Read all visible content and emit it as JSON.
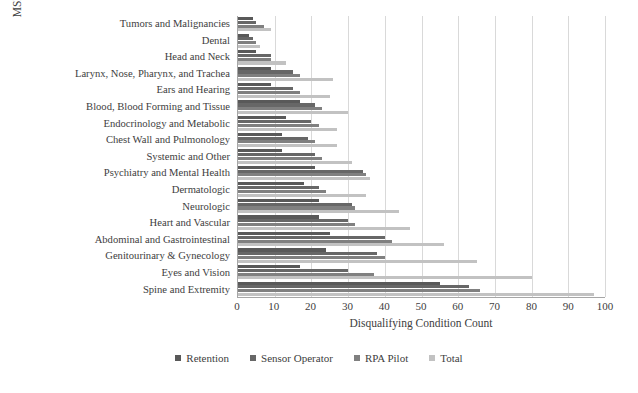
{
  "chart_data": {
    "type": "bar",
    "orientation": "horizontal",
    "title": "",
    "xlabel": "Disqualifying Condition Count",
    "ylabel": "MSD Disqualifying Condition Category",
    "xlim": [
      0,
      100
    ],
    "xticks": [
      0,
      10,
      20,
      30,
      40,
      50,
      60,
      70,
      80,
      90,
      100
    ],
    "grid": "vertical",
    "legend_position": "bottom",
    "categories": [
      "Tumors and Malignancies",
      "Dental",
      "Head and Neck",
      "Larynx, Nose, Pharynx, and Trachea",
      "Ears and Hearing",
      "Blood, Blood Forming and Tissue",
      "Endocrinology and Metabolic",
      "Chest Wall and Pulmonology",
      "Systemic and Other",
      "Psychiatry and Mental Health",
      "Dermatologic",
      "Neurologic",
      "Heart and Vascular",
      "Abdominal and Gastrointestinal",
      "Genitourinary & Gynecology",
      "Eyes and Vision",
      "Spine and Extremity"
    ],
    "series": [
      {
        "name": "Retention",
        "color": "#595959",
        "values": [
          4,
          3,
          5,
          9,
          9,
          17,
          13,
          12,
          12,
          21,
          18,
          22,
          22,
          25,
          24,
          17,
          55
        ]
      },
      {
        "name": "Sensor Operator",
        "color": "#676767",
        "values": [
          5,
          4,
          9,
          15,
          15,
          21,
          20,
          19,
          21,
          34,
          22,
          31,
          30,
          40,
          38,
          30,
          63
        ]
      },
      {
        "name": "RPA Pilot",
        "color": "#808080",
        "values": [
          7,
          5,
          9,
          17,
          17,
          23,
          22,
          21,
          23,
          35,
          24,
          32,
          32,
          42,
          40,
          37,
          66
        ]
      },
      {
        "name": "Total",
        "color": "#c2c2c2",
        "values": [
          9,
          6,
          13,
          26,
          25,
          30,
          27,
          27,
          31,
          36,
          35,
          44,
          47,
          56,
          65,
          80,
          97
        ]
      }
    ]
  },
  "legend": {
    "items": [
      {
        "label": "Retention"
      },
      {
        "label": "Sensor Operator"
      },
      {
        "label": "RPA Pilot"
      },
      {
        "label": "Total"
      }
    ]
  },
  "axes": {
    "x_title": "Disqualifying Condition Count",
    "y_title": "MSD Disqualifying Condition Category",
    "x_tick_labels": [
      "0",
      "10",
      "20",
      "30",
      "40",
      "50",
      "60",
      "70",
      "80",
      "90",
      "100"
    ]
  }
}
